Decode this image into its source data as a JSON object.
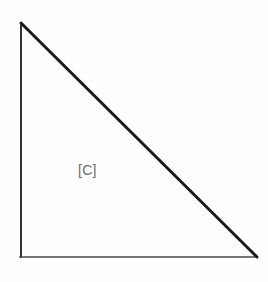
{
  "figure": {
    "name": "right-triangle-diagram",
    "background_color": "#fefefe",
    "width": 268,
    "height": 282,
    "shape": {
      "type": "right-triangle",
      "vertices": {
        "apex_top_left": [
          21,
          23
        ],
        "right_angle_bottom_left": [
          21,
          257
        ],
        "bottom_right": [
          256,
          257
        ]
      },
      "sides": [
        {
          "name": "vertical-leg",
          "from": [
            21,
            23
          ],
          "to": [
            21,
            257
          ],
          "color": "#333333",
          "thickness": 2
        },
        {
          "name": "horizontal-leg",
          "from": [
            21,
            257
          ],
          "to": [
            256,
            257
          ],
          "color": "#4a4a4a",
          "thickness": 1.6
        },
        {
          "name": "hypotenuse",
          "from": [
            21,
            23
          ],
          "to": [
            256,
            257
          ],
          "color": "#1a1a1a",
          "thickness": 3
        }
      ]
    },
    "labels": [
      {
        "name": "interior-region-label",
        "text": "[C]",
        "color": "#6a6a6a",
        "x": 78,
        "y": 162
      }
    ]
  }
}
